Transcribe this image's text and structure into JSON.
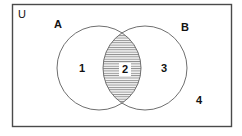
{
  "figure": {
    "type": "venn-diagram",
    "title_visible": false,
    "background_color": "#ffffff",
    "stroke_color": "#6f6f6f",
    "frame_stroke_color": "#4a4a4a",
    "text_color": "#121212",
    "hatch_color": "#8c8c8c",
    "hatch_background": "#f2f2f2"
  },
  "universe": {
    "label": "U",
    "shape": "rectangle",
    "x": 12,
    "y": 4,
    "width": 220,
    "height": 123
  },
  "sets": [
    {
      "label": "A",
      "cx": 99,
      "cy": 68,
      "r": 42,
      "label_x": 54,
      "label_y": 19,
      "filled": false
    },
    {
      "label": "B",
      "cx": 145,
      "cy": 68,
      "r": 42,
      "label_x": 181,
      "label_y": 22,
      "filled": false
    }
  ],
  "regions": [
    {
      "label": "1",
      "meaning": "A only",
      "shaded": false,
      "x": 79,
      "y": 63
    },
    {
      "label": "2",
      "meaning": "A intersect B",
      "shaded": true,
      "shading": "horizontal-hatch",
      "x": 119,
      "y": 63
    },
    {
      "label": "3",
      "meaning": "B only",
      "shaded": false,
      "x": 161,
      "y": 63
    },
    {
      "label": "4",
      "meaning": "outside A and B",
      "shaded": false,
      "x": 196,
      "y": 95
    }
  ]
}
